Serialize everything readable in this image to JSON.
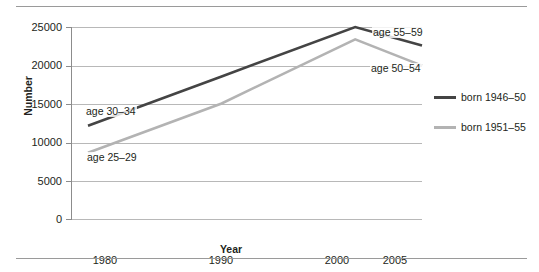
{
  "chart_data": {
    "type": "line",
    "title": "",
    "xlabel": "Year",
    "ylabel": "Number",
    "x": [
      1980,
      1990,
      2000,
      2005
    ],
    "xtick_labels": [
      "1980",
      "1990",
      "2000",
      "2005"
    ],
    "ytick_labels": [
      "0",
      "5000",
      "10000",
      "15000",
      "20000",
      "25000"
    ],
    "yticks": [
      0,
      5000,
      10000,
      15000,
      20000,
      25000
    ],
    "ylim": [
      0,
      25000
    ],
    "grid": "horizontal",
    "legend_position": "right",
    "series": [
      {
        "name": "born 1946-50",
        "label": "born 1946–50",
        "color": "#444444",
        "values": [
          12200,
          18600,
          25000,
          22600
        ]
      },
      {
        "name": "born 1951-55",
        "label": "born 1951–55",
        "color": "#b3b3b3",
        "values": [
          8700,
          15100,
          23400,
          20000
        ]
      }
    ],
    "annotations": [
      {
        "id": "age-30-34",
        "text": "age 30–34",
        "series": "born 1946-50",
        "x": 1980,
        "y": 12200
      },
      {
        "id": "age-25-29",
        "text": "age 25–29",
        "series": "born 1951-55",
        "x": 1980,
        "y": 8700
      },
      {
        "id": "age-55-59",
        "text": "age 55–59",
        "series": "born 1946-50",
        "x": 2005,
        "y": 22600
      },
      {
        "id": "age-50-54",
        "text": "age 50–54",
        "series": "born 1951-55",
        "x": 2005,
        "y": 20000
      }
    ]
  },
  "axes": {
    "y_title": "Number",
    "x_title": "Year",
    "y_ticks": [
      {
        "value": 25000,
        "label": "25000"
      },
      {
        "value": 20000,
        "label": "20000"
      },
      {
        "value": 15000,
        "label": "15000"
      },
      {
        "value": 10000,
        "label": "10000"
      },
      {
        "value": 5000,
        "label": "5000"
      },
      {
        "value": 0,
        "label": "0"
      }
    ],
    "x_ticks": [
      {
        "value": 1980,
        "label": "1980"
      },
      {
        "value": 1990,
        "label": "1990"
      },
      {
        "value": 2000,
        "label": "2000"
      },
      {
        "value": 2005,
        "label": "2005"
      }
    ]
  },
  "legend": {
    "items": [
      {
        "label": "born 1946–50",
        "color": "#444444"
      },
      {
        "label": "born 1951–55",
        "color": "#b3b3b3"
      }
    ]
  },
  "annotations": {
    "age_30_34": "age 30–34",
    "age_25_29": "age 25–29",
    "age_55_59": "age 55–59",
    "age_50_54": "age 50–54"
  },
  "colors": {
    "series_dark": "#444444",
    "series_light": "#b3b3b3",
    "gridline": "#b8b8b8",
    "axis": "#8c8c8c",
    "rule": "#9a9a9a",
    "text": "#231f20"
  }
}
